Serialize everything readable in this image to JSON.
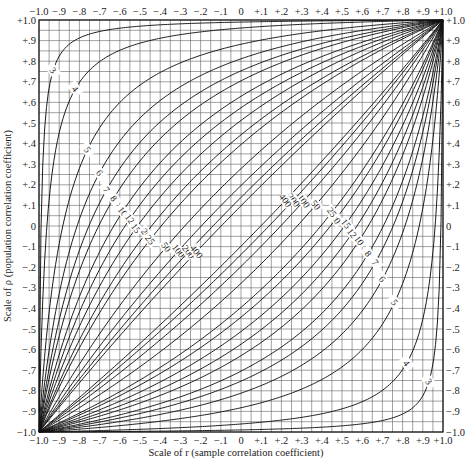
{
  "chart_data": {
    "type": "line",
    "title": "",
    "xlabel": "Scale of r  (sample correlation coefficient)",
    "ylabel": "Scale of ρ (population correlation coefficient)",
    "xlim": [
      -1.0,
      1.0
    ],
    "ylim": [
      -1.0,
      1.0
    ],
    "grid": true,
    "grid_step": 0.05,
    "x_ticks": [
      "-1.0",
      "-.9",
      "-.8",
      "-.7",
      "-.6",
      "-.5",
      "-.4",
      "-.3",
      "-.2",
      "-.1",
      "0",
      "+.1",
      "+.2",
      "+.3",
      "+.4",
      "+.5",
      "+.6",
      "+.7",
      "+.8",
      "+.9",
      "+1.0"
    ],
    "y_ticks": [
      "+1.0",
      "+.9",
      "+.8",
      "+.7",
      "+.6",
      "+.5",
      "+.4",
      "+.3",
      "+.2",
      "+.1",
      "0",
      "-.1",
      "-.2",
      "-.3",
      "-.4",
      "-.5",
      "-.6",
      "-.7",
      "-.8",
      "-.9",
      "-1.0"
    ],
    "legend": "none",
    "curve_labels": [
      "3",
      "4",
      "5",
      "6",
      "7",
      "8",
      "10",
      "12",
      "15",
      "20",
      "25",
      "50",
      "100",
      "200",
      "400"
    ],
    "sample_sizes": [
      3,
      4,
      5,
      6,
      7,
      8,
      10,
      12,
      15,
      20,
      25,
      50,
      100,
      200,
      400
    ],
    "series": [
      {
        "name": "upper confidence band",
        "labels": [
          "3",
          "4",
          "5",
          "6",
          "7",
          "8",
          "10",
          "12",
          "15",
          "20",
          "25",
          "50",
          "100",
          "200",
          "400"
        ]
      },
      {
        "name": "lower confidence band",
        "labels": [
          "400",
          "200",
          "100",
          "50",
          "25",
          "20",
          "15",
          "12",
          "10",
          "8",
          "7",
          "6",
          "5",
          "4",
          "3"
        ]
      }
    ]
  },
  "axes": {
    "x_title": "Scale of r  (sample correlation coefficient)",
    "y_title": "Scale of ρ (population correlation coefficient)"
  }
}
